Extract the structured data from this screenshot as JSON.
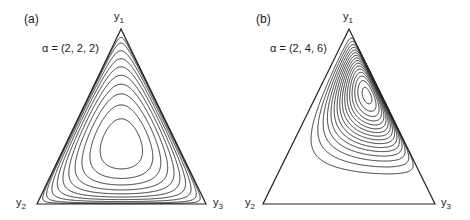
{
  "figure": {
    "panels": [
      {
        "id": "a",
        "label": "(a)",
        "alpha_text": "α = (2, 2, 2)",
        "alpha": [
          2,
          2,
          2
        ],
        "vertices": {
          "top": "y",
          "top_sub": "1",
          "left": "y",
          "left_sub": "2",
          "right": "y",
          "right_sub": "3"
        },
        "contour_count": 10
      },
      {
        "id": "b",
        "label": "(b)",
        "alpha_text": "α = (2, 4, 6)",
        "alpha": [
          2,
          4,
          6
        ],
        "vertices": {
          "top": "y",
          "top_sub": "1",
          "left": "y",
          "left_sub": "2",
          "right": "y",
          "right_sub": "3"
        },
        "contour_count": 16
      }
    ],
    "colors": {
      "line": "#222222",
      "background": "#ffffff"
    }
  }
}
